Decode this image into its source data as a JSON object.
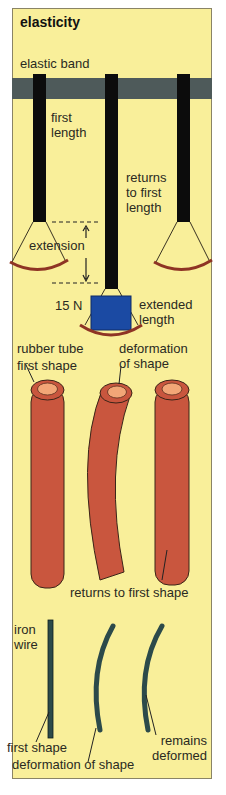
{
  "title": "elasticity",
  "colors": {
    "panel_bg": "#f9ef9a",
    "bar": "#4e5a5a",
    "band": "#0c0c0c",
    "rubber": "#c9563e",
    "rubber_inner": "#f2a677",
    "weight": "#1b4aa3",
    "pan_rim": "#8e3424",
    "wire": "#2c4a4a"
  },
  "sections": {
    "elastic_band": {
      "heading": "elastic band",
      "labels": {
        "first_length": [
          "first",
          "length"
        ],
        "extension": "extension",
        "returns": [
          "returns",
          "to first",
          "length"
        ],
        "weight": "15 N",
        "extended": [
          "extended",
          "length"
        ]
      }
    },
    "rubber_tube": {
      "heading": "rubber tube",
      "labels": {
        "first_shape": "first shape",
        "deformation": [
          "deformation",
          "of shape"
        ],
        "returns": "returns to first shape"
      }
    },
    "iron_wire": {
      "heading": [
        "iron",
        "wire"
      ],
      "labels": {
        "first_shape": "first shape",
        "deformation": "deformation of shape",
        "remains": [
          "remains",
          "deformed"
        ]
      }
    }
  }
}
